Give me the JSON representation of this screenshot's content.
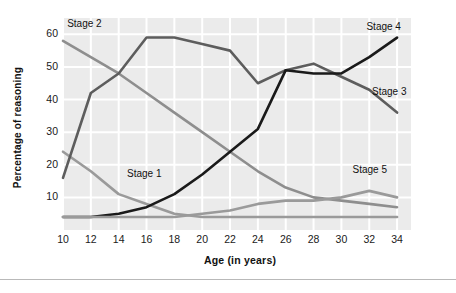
{
  "chart_data": {
    "type": "line",
    "title": "",
    "xlabel": "Age (in years)",
    "ylabel": "Percentage of reasoning",
    "xlim": [
      10,
      35
    ],
    "ylim": [
      0,
      65
    ],
    "grid": true,
    "legend_position": "inline-end-of-line",
    "x": [
      10,
      12,
      14,
      16,
      18,
      20,
      22,
      24,
      26,
      28,
      30,
      32,
      34
    ],
    "xticks": [
      "10",
      "12",
      "14",
      "16",
      "18",
      "20",
      "22",
      "24",
      "26",
      "28",
      "30",
      "32",
      "34"
    ],
    "yticks": [
      "10",
      "20",
      "30",
      "40",
      "50",
      "60"
    ],
    "series": [
      {
        "name": "Stage 1",
        "color": "#9a9a9a",
        "label_x": 14.6,
        "label_y": 17,
        "values": [
          24,
          18,
          11,
          8,
          5,
          4,
          4,
          4,
          4,
          4,
          4,
          4,
          4
        ]
      },
      {
        "name": "Stage 2",
        "color": "#8e8e8e",
        "label_x": 10.3,
        "label_y": 63,
        "values": [
          58,
          53,
          48,
          42,
          36,
          30,
          24,
          18,
          13,
          10,
          9,
          8,
          7
        ]
      },
      {
        "name": "Stage 3",
        "color": "#5d5d5d",
        "label_x": 32.2,
        "label_y": 42,
        "values": [
          16,
          42,
          48,
          59,
          59,
          57,
          55,
          45,
          49,
          51,
          47,
          43,
          36
        ]
      },
      {
        "name": "Stage 4",
        "color": "#1a1a1a",
        "label_x": 31.8,
        "label_y": 62,
        "values": [
          4,
          4,
          5,
          7,
          11,
          17,
          24,
          31,
          49,
          48,
          48,
          53,
          59
        ]
      },
      {
        "name": "Stage 5",
        "color": "#9a9a9a",
        "label_x": 30.8,
        "label_y": 18,
        "values": [
          4,
          4,
          4,
          4,
          4,
          5,
          6,
          8,
          9,
          9,
          10,
          12,
          10
        ]
      }
    ]
  }
}
